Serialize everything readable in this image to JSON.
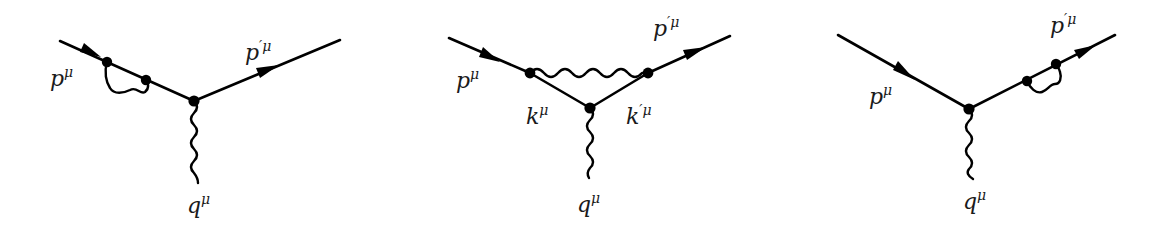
{
  "figure": {
    "stroke_color": "#000000",
    "background": "#ffffff"
  },
  "diagrams": [
    {
      "id": "left",
      "type": "incoming-leg self-energy correction",
      "labels": {
        "incoming": {
          "base": "p",
          "sup": "μ"
        },
        "outgoing": {
          "base": "p",
          "sup": "′μ"
        },
        "photon": {
          "base": "q",
          "sup": "μ"
        }
      }
    },
    {
      "id": "middle",
      "type": "vertex correction (triangle)",
      "labels": {
        "incoming": {
          "base": "p",
          "sup": "μ"
        },
        "outgoing": {
          "base": "p",
          "sup": "′μ"
        },
        "internal_left": {
          "base": "k",
          "sup": "μ"
        },
        "internal_right": {
          "base": "k",
          "sup": "′μ"
        },
        "photon": {
          "base": "q",
          "sup": "μ"
        }
      }
    },
    {
      "id": "right",
      "type": "outgoing-leg self-energy correction",
      "labels": {
        "incoming": {
          "base": "p",
          "sup": "μ"
        },
        "outgoing": {
          "base": "p",
          "sup": "′μ"
        },
        "photon": {
          "base": "q",
          "sup": "μ"
        }
      }
    }
  ]
}
